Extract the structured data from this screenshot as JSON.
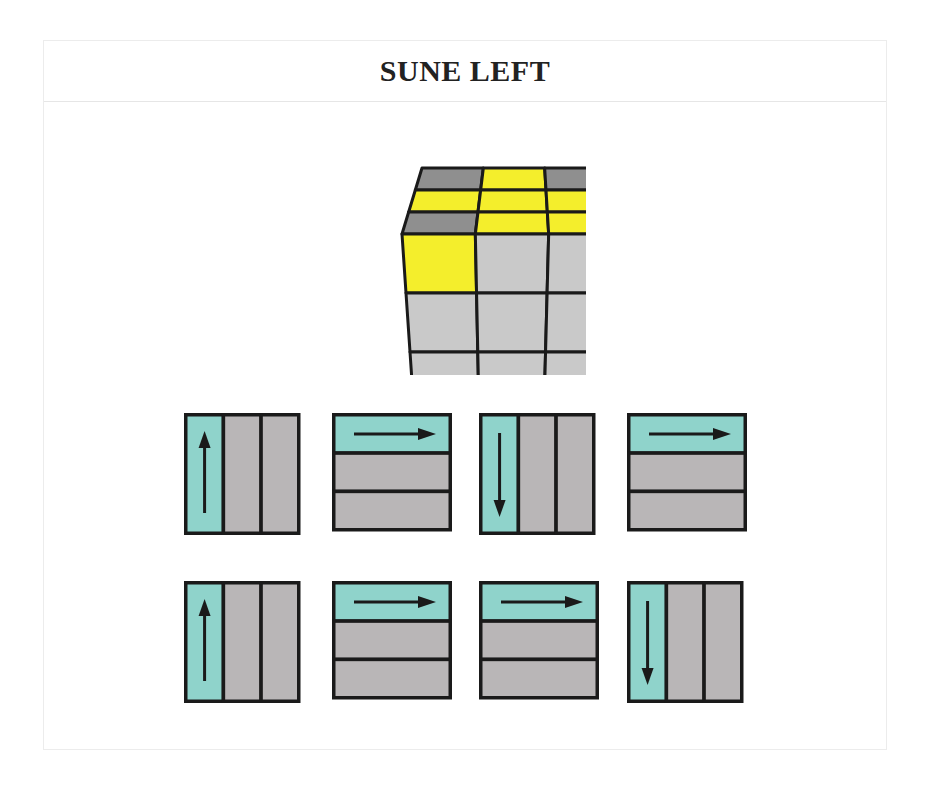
{
  "title": "SUNE LEFT",
  "colors": {
    "yellow": "#f4ee2c",
    "light_gray": "#c9c9c9",
    "dark_gray": "#8f8f8f",
    "teal": "#8fd3cb",
    "move_gray": "#b9b6b7",
    "outline": "#1a1a1a"
  },
  "cube": {
    "top_face": [
      [
        "dark_gray",
        "yellow",
        "dark_gray"
      ],
      [
        "yellow",
        "yellow",
        "yellow"
      ],
      [
        "dark_gray",
        "yellow",
        "yellow"
      ]
    ],
    "front_face": [
      [
        "yellow",
        "light_gray",
        "light_gray"
      ],
      [
        "light_gray",
        "light_gray",
        "light_gray"
      ],
      [
        "light_gray",
        "light_gray",
        "light_gray"
      ]
    ]
  },
  "moves": [
    {
      "row": 0,
      "col": 0,
      "type": "column",
      "highlight": "left",
      "direction": "up"
    },
    {
      "row": 0,
      "col": 1,
      "type": "row",
      "highlight": "top",
      "direction": "right"
    },
    {
      "row": 0,
      "col": 2,
      "type": "column",
      "highlight": "left",
      "direction": "down"
    },
    {
      "row": 0,
      "col": 3,
      "type": "row",
      "highlight": "top",
      "direction": "right"
    },
    {
      "row": 1,
      "col": 0,
      "type": "column",
      "highlight": "left",
      "direction": "up"
    },
    {
      "row": 1,
      "col": 1,
      "type": "row",
      "highlight": "top",
      "direction": "right"
    },
    {
      "row": 1,
      "col": 2,
      "type": "row",
      "highlight": "top",
      "direction": "right"
    },
    {
      "row": 1,
      "col": 3,
      "type": "column",
      "highlight": "left",
      "direction": "down"
    }
  ]
}
